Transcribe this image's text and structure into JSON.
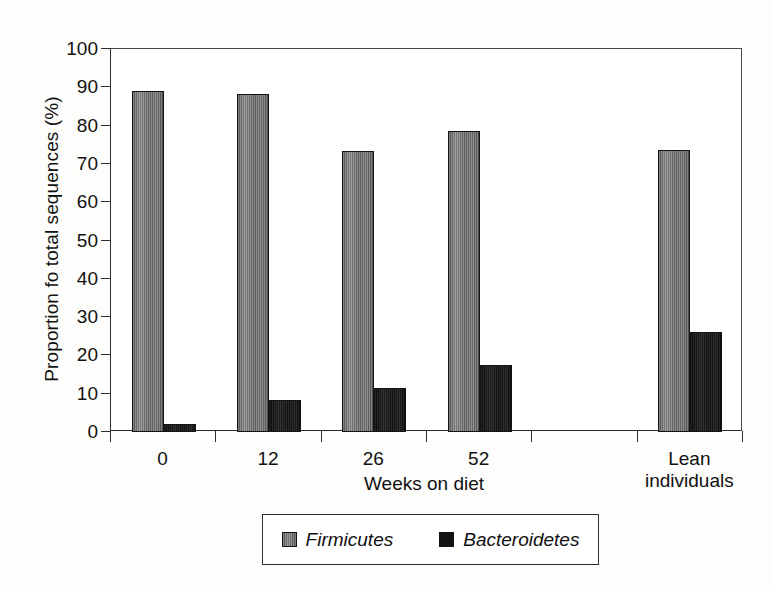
{
  "chart_data": {
    "type": "bar",
    "title": "",
    "xlabel": "Weeks on diet",
    "ylabel": "Proportion fo total sequences (%)",
    "categories": [
      "0",
      "12",
      "26",
      "52",
      "",
      "Lean\nindividuals"
    ],
    "series": [
      {
        "name": "Firmicutes",
        "color": "#6b6b6b",
        "values": [
          89.0,
          88.2,
          73.3,
          78.5,
          null,
          73.7
        ]
      },
      {
        "name": "Bacteroidetes",
        "color": "#151515",
        "values": [
          2.1,
          8.3,
          11.4,
          17.6,
          null,
          26.2
        ]
      }
    ],
    "ylim": [
      0,
      100
    ],
    "yticks": [
      0,
      10,
      20,
      30,
      40,
      50,
      60,
      70,
      80,
      90,
      100
    ],
    "ytick_labels": [
      "0",
      "10",
      "20",
      "30",
      "40",
      "50",
      "60",
      "70",
      "80",
      "90",
      "100"
    ],
    "grid": false,
    "legend_position": "bottom",
    "legend_entries": [
      "Firmicutes",
      "Bacteroidetes"
    ]
  },
  "axes": {
    "y_title": "Proportion fo total sequences (%)",
    "x_title": "Weeks on diet"
  },
  "legend": {
    "items": [
      {
        "label": "Firmicutes"
      },
      {
        "label": "Bacteroidetes"
      }
    ]
  }
}
